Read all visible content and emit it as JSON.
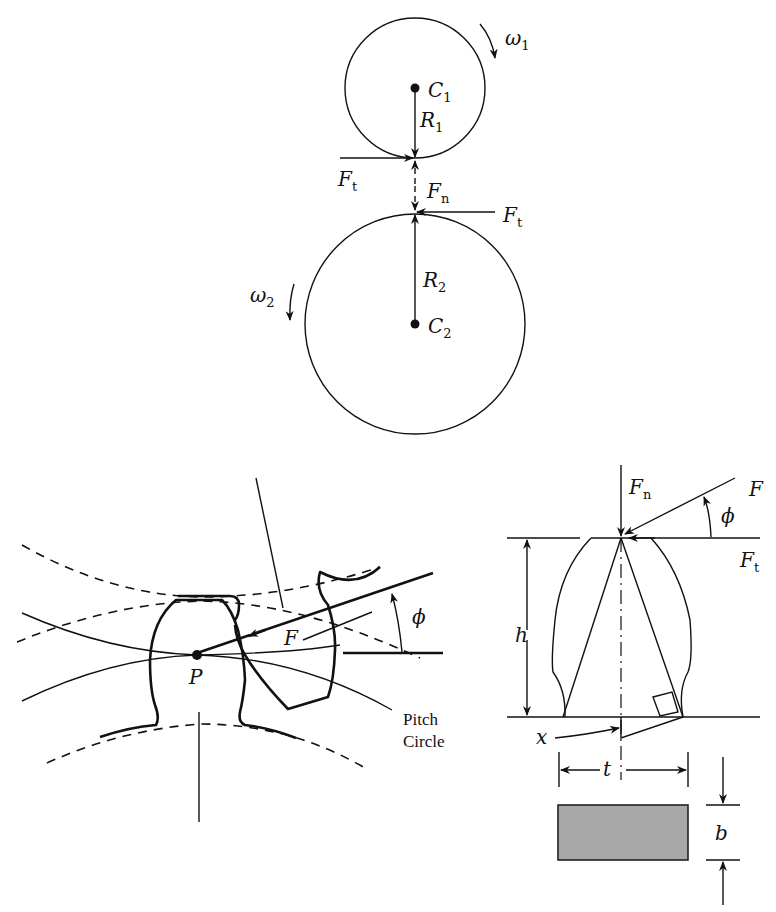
{
  "figure": {
    "top_diagram": {
      "description": "Two meshing pitch circles with contact forces",
      "gear1": {
        "center_label": "C",
        "center_sub": "1",
        "radius_label": "R",
        "radius_sub": "1",
        "speed_label": "ω",
        "speed_sub": "1"
      },
      "gear2": {
        "center_label": "C",
        "center_sub": "2",
        "radius_label": "R",
        "radius_sub": "2",
        "speed_label": "ω",
        "speed_sub": "2"
      },
      "forces": {
        "tangential_left": {
          "label": "F",
          "sub": "t"
        },
        "normal": {
          "label": "F",
          "sub": "n"
        },
        "tangential_right": {
          "label": "F",
          "sub": "t"
        }
      }
    },
    "bottom_left_diagram": {
      "description": "Gear teeth meshing at pitch point",
      "pitch_point_label": "P",
      "force_label": "F",
      "pressure_angle_label": "ϕ",
      "pitch_circle_label_line1": "Pitch",
      "pitch_circle_label_line2": "Circle"
    },
    "bottom_right_diagram": {
      "description": "Gear tooth as cantilever beam",
      "normal_force": {
        "label": "F",
        "sub": "n"
      },
      "resultant_force": {
        "label": "F"
      },
      "pressure_angle_label": "ϕ",
      "tangential_force": {
        "label": "F",
        "sub": "t"
      },
      "height_label": "h",
      "x_label": "x",
      "thickness_label": "t",
      "width_label": "b",
      "section_fill": "#a8a8a8"
    }
  }
}
